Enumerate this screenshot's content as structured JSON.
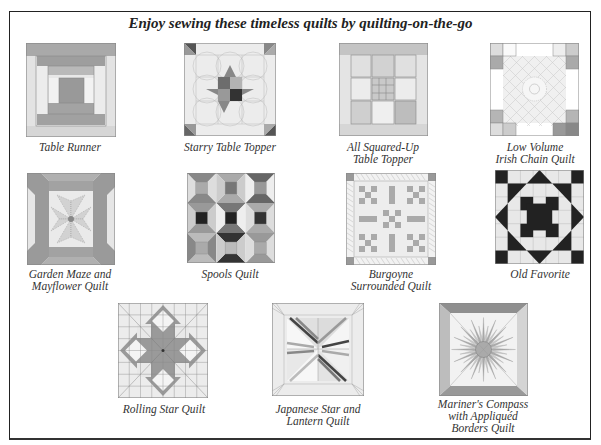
{
  "title": "Enjoy sewing these timeless quilts by quilting-on-the-go",
  "quilts": [
    {
      "id": "table-runner",
      "caption": [
        "Table Runner"
      ]
    },
    {
      "id": "starry-table-topper",
      "caption": [
        "Starry Table Topper"
      ]
    },
    {
      "id": "all-squared-up",
      "caption": [
        "All Squared-Up",
        "Table Topper"
      ]
    },
    {
      "id": "low-volume",
      "caption": [
        "Low Volume",
        "Irish Chain Quilt"
      ]
    },
    {
      "id": "garden-maze",
      "caption": [
        "Garden Maze and",
        "Mayflower Quilt"
      ]
    },
    {
      "id": "spools",
      "caption": [
        "Spools Quilt"
      ]
    },
    {
      "id": "burgoyne",
      "caption": [
        "Burgoyne",
        "Surrounded Quilt"
      ]
    },
    {
      "id": "old-favorite",
      "caption": [
        "Old Favorite"
      ]
    },
    {
      "id": "rolling-star",
      "caption": [
        "Rolling Star Quilt"
      ]
    },
    {
      "id": "japanese-star",
      "caption": [
        "Japanese Star and",
        "Lantern Quilt"
      ]
    },
    {
      "id": "mariners-compass",
      "caption": [
        "Mariner's Compass",
        "with Appliquéd",
        "Borders Quilt"
      ]
    }
  ]
}
